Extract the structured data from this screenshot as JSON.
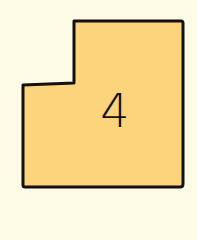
{
  "shape": {
    "type": "L-shaped region",
    "label": "4",
    "fill_color": "#fcd47c",
    "stroke_color": "#111111"
  },
  "background_color": "#fdfbe6"
}
